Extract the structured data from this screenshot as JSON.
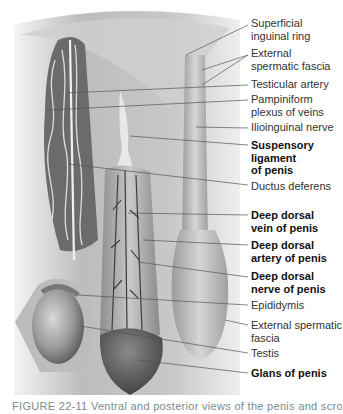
{
  "figure": {
    "labels": [
      {
        "id": "superficial-inguinal-ring",
        "text": "Superficial inguinal ring",
        "lines": [
          "Superficial",
          "inguinal ring"
        ],
        "bold": false
      },
      {
        "id": "external-spermatic-fascia-top",
        "text": "External spermatic fascia",
        "lines": [
          "External",
          "spermatic fascia"
        ],
        "bold": false
      },
      {
        "id": "testicular-artery",
        "text": "Testicular artery",
        "lines": [
          "Testicular artery"
        ],
        "bold": false
      },
      {
        "id": "pampiniform-plexus",
        "text": "Pampiniform plexus of veins",
        "lines": [
          "Pampiniform",
          "plexus of veins"
        ],
        "bold": false
      },
      {
        "id": "ilioinguinal-nerve",
        "text": "Ilioinguinal nerve",
        "lines": [
          "Ilioinguinal nerve"
        ],
        "bold": false
      },
      {
        "id": "suspensory-ligament",
        "text": "Suspensory ligament of penis",
        "lines": [
          "Suspensory",
          "ligament",
          "of penis"
        ],
        "bold": true
      },
      {
        "id": "ductus-deferens",
        "text": "Ductus deferens",
        "lines": [
          "Ductus deferens"
        ],
        "bold": false
      },
      {
        "id": "deep-dorsal-vein",
        "text": "Deep dorsal vein of penis",
        "lines": [
          "Deep dorsal",
          "vein of penis"
        ],
        "bold": true
      },
      {
        "id": "deep-dorsal-artery",
        "text": "Deep dorsal artery of penis",
        "lines": [
          "Deep dorsal",
          "artery of penis"
        ],
        "bold": true
      },
      {
        "id": "deep-dorsal-nerve",
        "text": "Deep dorsal nerve of penis",
        "lines": [
          "Deep dorsal",
          "nerve of penis"
        ],
        "bold": true
      },
      {
        "id": "epididymis",
        "text": "Epididymis",
        "lines": [
          "Epididymis"
        ],
        "bold": false
      },
      {
        "id": "external-spermatic-fascia-bottom",
        "text": "External spermatic fascia",
        "lines": [
          "External spermatic",
          "fascia"
        ],
        "bold": false
      },
      {
        "id": "testis",
        "text": "Testis",
        "lines": [
          "Testis"
        ],
        "bold": false
      },
      {
        "id": "glans-of-penis",
        "text": "Glans of penis",
        "lines": [
          "Glans of penis"
        ],
        "bold": true
      }
    ],
    "caption": "FIGURE 22-11  Ventral and posterior views of the penis and scrotum (cropped)"
  }
}
